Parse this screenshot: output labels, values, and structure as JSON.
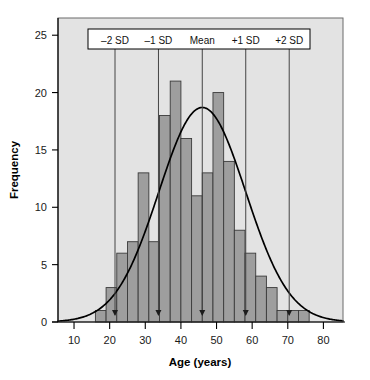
{
  "chart_data": {
    "type": "bar",
    "title": "",
    "subtitle": "",
    "xlabel": "Age (years)",
    "ylabel": "Frequency",
    "xlim": [
      5.5,
      85.5
    ],
    "ylim": [
      0,
      26.5
    ],
    "grid": false,
    "legend_position": "top-inside",
    "x_ticks": [
      10,
      20,
      30,
      40,
      50,
      60,
      70,
      80
    ],
    "x_tick_labels": [
      "10",
      "20",
      "30",
      "40",
      "50",
      "60",
      "70",
      "80"
    ],
    "y_ticks": [
      0,
      5,
      10,
      15,
      20,
      25
    ],
    "y_tick_labels": [
      "0",
      "5",
      "10",
      "15",
      "20",
      "25"
    ],
    "bin_width": 3,
    "bin_starts": [
      16,
      19,
      22,
      25,
      28,
      31,
      34,
      37,
      40,
      43,
      46,
      49,
      52,
      55,
      58,
      61,
      64,
      67,
      70,
      73
    ],
    "categories": [
      "16-19",
      "19-22",
      "22-25",
      "25-28",
      "28-31",
      "31-34",
      "34-37",
      "37-40",
      "40-43",
      "43-46",
      "46-49",
      "49-52",
      "52-55",
      "55-58",
      "58-61",
      "61-64",
      "64-67",
      "67-70",
      "70-73",
      "73-76"
    ],
    "values": [
      1,
      3,
      6,
      7,
      13,
      7,
      18,
      21,
      16,
      11,
      13,
      20,
      14,
      8,
      6,
      4,
      3,
      1,
      1,
      1
    ],
    "bars": [
      {
        "start": 16,
        "end": 19,
        "value": 1
      },
      {
        "start": 19,
        "end": 22,
        "value": 3
      },
      {
        "start": 22,
        "end": 25,
        "value": 6
      },
      {
        "start": 25,
        "end": 28,
        "value": 7
      },
      {
        "start": 28,
        "end": 31,
        "value": 13
      },
      {
        "start": 31,
        "end": 34,
        "value": 7
      },
      {
        "start": 34,
        "end": 37,
        "value": 18
      },
      {
        "start": 37,
        "end": 40,
        "value": 21
      },
      {
        "start": 40,
        "end": 43,
        "value": 16
      },
      {
        "start": 43,
        "end": 46,
        "value": 11
      },
      {
        "start": 46,
        "end": 49,
        "value": 13
      },
      {
        "start": 49,
        "end": 52,
        "value": 20
      },
      {
        "start": 52,
        "end": 55,
        "value": 14
      },
      {
        "start": 55,
        "end": 58,
        "value": 8
      },
      {
        "start": 58,
        "end": 61,
        "value": 6
      },
      {
        "start": 61,
        "end": 64,
        "value": 4
      },
      {
        "start": 64,
        "end": 67,
        "value": 3
      },
      {
        "start": 67,
        "end": 70,
        "value": 1
      },
      {
        "start": 70,
        "end": 73,
        "value": 1
      },
      {
        "start": 73,
        "end": 76,
        "value": 1
      }
    ],
    "overlay_curve": {
      "type": "normal",
      "mean": 46,
      "sd": 12.2,
      "peak_value": 18.7,
      "label": "normal-distribution-curve"
    },
    "reference_lines": [
      {
        "id": "minus-2-sd",
        "label": "–2 SD",
        "x": 21.5
      },
      {
        "id": "minus-1-sd",
        "label": "–1 SD",
        "x": 33.7
      },
      {
        "id": "mean",
        "label": "Mean",
        "x": 46.0
      },
      {
        "id": "plus-1-sd",
        "label": "+1 SD",
        "x": 58.2
      },
      {
        "id": "plus-2-sd",
        "label": "+2 SD",
        "x": 70.4
      }
    ],
    "colors": {
      "bar_fill": "#9e9e9e",
      "bar_edge": "#3a3a3a",
      "plot_background": "#e3e3e3",
      "curve": "#000000",
      "axis": "#000000",
      "legend_background": "#ffffff",
      "legend_border": "#000000",
      "reference_line": "#444444"
    }
  }
}
